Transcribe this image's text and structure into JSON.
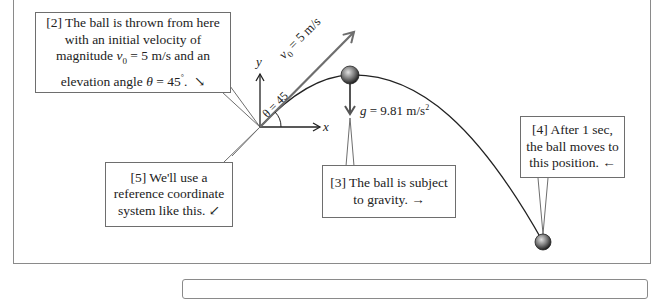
{
  "diagram": {
    "callouts": [
      {
        "id": "2",
        "lines": [
          "[2] The ball is thrown from here",
          "with an initial velocity of",
          "magnitude",
          "= 5 m/s  and an",
          "elevation angle",
          "= 45",
          ".",
          "↘"
        ],
        "full_text": "[2] The ball is thrown from here with an initial velocity of magnitude v0 = 5 m/s and an elevation angle θ = 45°. ↘"
      },
      {
        "id": "3",
        "lines": [
          "[3] The ball is subject",
          "to gravity.  →"
        ],
        "full_text": "[3] The ball is subject to gravity. →"
      },
      {
        "id": "4",
        "lines": [
          "[4] After 1 sec,",
          "the ball moves to",
          "this position.  ←"
        ],
        "full_text": "[4] After 1 sec, the ball moves to this position. ←"
      },
      {
        "id": "5",
        "lines": [
          "[5] We'll use a",
          "reference coordinate",
          "system like this.  ↙"
        ],
        "full_text": "[5] We'll use a reference coordinate system like this. ↙"
      }
    ],
    "labels": {
      "y_axis": "y",
      "x_axis": "x",
      "velocity": "v",
      "velocity_sub": "0",
      "velocity_value": " = 5 m/s",
      "angle": "θ = 45",
      "gravity_g": "g",
      "gravity_value": " = 9.81 m/s",
      "gravity_exp": "2"
    },
    "colors": {
      "line": "#222222",
      "velocity_arrow": "#6e6e6e",
      "border": "#8a8a8a",
      "ball_dark": "#2b2b2b",
      "ball_light": "#d8d8d8"
    }
  }
}
